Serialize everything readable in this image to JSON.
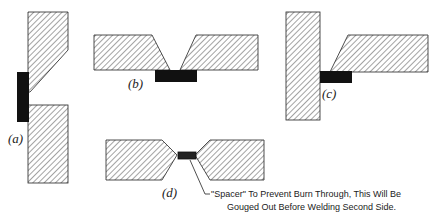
{
  "figures": [
    {
      "id": "a",
      "label": "(a)",
      "description": "Vertical plates with single-bevel, backing strip on left side"
    },
    {
      "id": "b",
      "label": "(b)",
      "description": "Horizontal V-groove butt joint with backing strip underneath"
    },
    {
      "id": "c",
      "label": "(c)",
      "description": "T-joint with bevelled horizontal plate and backing strip"
    },
    {
      "id": "d",
      "label": "(d)",
      "description": "Double-V butt joint with spacer in root"
    }
  ],
  "annotation": {
    "line1": "\"Spacer\" To Prevent Burn Through, This Will Be",
    "line2": "Gouged Out Before Welding Second Side."
  },
  "colors": {
    "hatch": "#333333",
    "backing": "#111111",
    "outline": "#222222"
  }
}
